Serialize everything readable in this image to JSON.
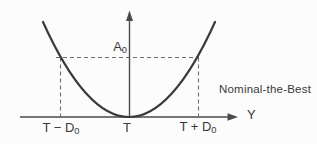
{
  "diagram": {
    "title": "Nominal-the-Best",
    "labels": {
      "a0": {
        "base": "A",
        "sub": "0"
      },
      "t_minus_d0": {
        "base": "T − D",
        "sub": "0"
      },
      "t": "T",
      "t_plus_d0": {
        "base": "T + D",
        "sub": "0"
      },
      "y_axis": "Y"
    },
    "colors": {
      "background": "#fcfcfc",
      "curve": "#3a3a3a",
      "axis": "#4a4a4a",
      "dashed": "#6e6e6e",
      "text": "#3a3a3a"
    }
  }
}
